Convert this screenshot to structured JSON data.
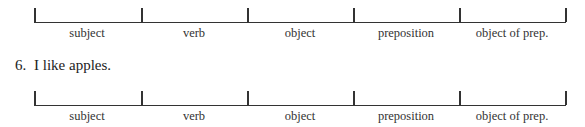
{
  "diagrams": [
    {
      "labels": [
        "subject",
        "verb",
        "object",
        "preposition",
        "object of prep."
      ]
    },
    {
      "labels": [
        "subject",
        "verb",
        "object",
        "preposition",
        "object of prep."
      ]
    }
  ],
  "sentence": {
    "number": "6.",
    "text": "I like apples."
  }
}
